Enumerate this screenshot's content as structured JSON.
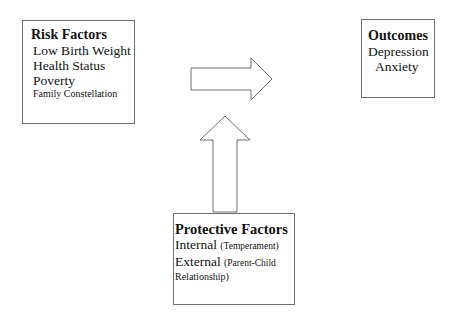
{
  "risk_factors": {
    "title": "Risk Factors",
    "items": [
      "Low Birth Weight",
      "Health Status",
      "Poverty"
    ],
    "small_item": "Family Constellation"
  },
  "outcomes": {
    "title": "Outcomes",
    "items": [
      "Depression",
      "Anxiety"
    ]
  },
  "protective_factors": {
    "title": "Protective Factors",
    "internal_label": "Internal",
    "internal_note": "(Temperament)",
    "external_label": "External",
    "external_note": "(Parent-Child",
    "external_note_cont": "Relationship)"
  },
  "arrows": [
    {
      "name": "risk-to-outcomes",
      "direction": "right"
    },
    {
      "name": "protective-to-relationship",
      "direction": "up"
    }
  ],
  "colors": {
    "stroke": "#6e6e6e",
    "text": "#111111",
    "background": "#ffffff"
  }
}
